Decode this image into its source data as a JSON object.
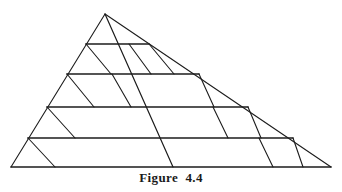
{
  "figure": {
    "caption": "Figure  4.4",
    "caption_label": "Figure",
    "caption_number": "4.4",
    "background_color": "#ffffff",
    "stroke_color": "#1c1c1c",
    "canvas": {
      "width": 342,
      "height": 192
    },
    "vertices": {
      "apex": {
        "x": 105,
        "y": 14
      },
      "bottom_left": {
        "x": 11,
        "y": 167
      },
      "bottom_right": {
        "x": 331,
        "y": 167
      }
    },
    "outline": [
      {
        "name": "left-edge",
        "x1": 105,
        "y1": 14,
        "x2": 11,
        "y2": 167,
        "width": 1.1
      },
      {
        "name": "right-edge",
        "x1": 105,
        "y1": 14,
        "x2": 331,
        "y2": 167,
        "width": 1.1
      },
      {
        "name": "base-edge",
        "x1": 11,
        "y1": 167,
        "x2": 331,
        "y2": 167,
        "width": 1.6
      }
    ],
    "horizontals": [
      {
        "name": "horizontal-band-1",
        "y": 44,
        "x1": 86,
        "x2": 149,
        "width": 1.7
      },
      {
        "name": "horizontal-band-2",
        "y": 74,
        "x1": 67,
        "x2": 199,
        "width": 1.7
      },
      {
        "name": "horizontal-band-3",
        "y": 107,
        "x1": 47,
        "x2": 248,
        "width": 1.7
      },
      {
        "name": "horizontal-band-4",
        "y": 138,
        "x1": 28,
        "x2": 293,
        "width": 1.7
      }
    ],
    "oblique_lines": [
      {
        "name": "long-diagonal-apex-to-base",
        "x1": 105,
        "y1": 14,
        "x2": 173,
        "y2": 167,
        "width": 1.2
      },
      {
        "name": "oblique-left-1",
        "x1": 86,
        "y1": 44,
        "x2": 111,
        "y2": 74,
        "width": 1.1
      },
      {
        "name": "oblique-left-2",
        "x1": 67,
        "y1": 74,
        "x2": 94,
        "y2": 107,
        "width": 1.1
      },
      {
        "name": "oblique-left-3",
        "x1": 47,
        "y1": 107,
        "x2": 75,
        "y2": 138,
        "width": 1.1
      },
      {
        "name": "oblique-left-4",
        "x1": 28,
        "y1": 138,
        "x2": 55,
        "y2": 167,
        "width": 1.1
      },
      {
        "name": "oblique-mid-1",
        "x1": 129,
        "y1": 44,
        "x2": 151,
        "y2": 74,
        "width": 1.1
      },
      {
        "name": "oblique-mid-2",
        "x1": 149,
        "y1": 44,
        "x2": 174,
        "y2": 74,
        "width": 1.1
      },
      {
        "name": "oblique-mid-3",
        "x1": 199,
        "y1": 74,
        "x2": 214,
        "y2": 107,
        "width": 1.1
      },
      {
        "name": "oblique-mid-4",
        "x1": 248,
        "y1": 107,
        "x2": 261,
        "y2": 138,
        "width": 1.1
      },
      {
        "name": "oblique-mid-5",
        "x1": 293,
        "y1": 138,
        "x2": 303,
        "y2": 167,
        "width": 1.1
      },
      {
        "name": "oblique-right-1",
        "x1": 112,
        "y1": 74,
        "x2": 131,
        "y2": 107,
        "width": 1.1
      },
      {
        "name": "oblique-right-2",
        "x1": 213,
        "y1": 107,
        "x2": 228,
        "y2": 138,
        "width": 1.1
      },
      {
        "name": "oblique-right-3",
        "x1": 259,
        "y1": 138,
        "x2": 273,
        "y2": 167,
        "width": 1.1
      }
    ]
  }
}
